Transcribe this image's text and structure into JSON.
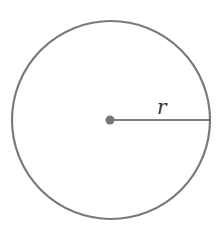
{
  "diagram": {
    "title": "",
    "shape": "circle",
    "radius_label": "r",
    "colors": {
      "background": "#ffffff",
      "outline": "#7a7a7a",
      "center_point": "#767676",
      "radius_line": "#555555",
      "label": "#333333"
    },
    "elements": [
      {
        "name": "circle-outline",
        "type": "circle"
      },
      {
        "name": "center-point",
        "type": "point"
      },
      {
        "name": "radius-line",
        "type": "segment",
        "label": "r"
      }
    ]
  }
}
